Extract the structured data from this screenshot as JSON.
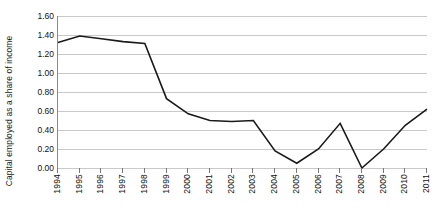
{
  "chart_data": {
    "type": "line",
    "title": "",
    "xlabel": "",
    "ylabel": "Capital employed as a share of income",
    "categories": [
      "1994",
      "1995",
      "1996",
      "1997",
      "1998",
      "1999",
      "2000",
      "2001",
      "2002",
      "2003",
      "2004",
      "2005",
      "2006",
      "2007",
      "2008",
      "2009",
      "2010",
      "2011"
    ],
    "values": [
      1.32,
      1.39,
      1.36,
      1.33,
      1.31,
      0.73,
      0.57,
      0.5,
      0.49,
      0.5,
      0.18,
      0.05,
      0.2,
      0.47,
      0.0,
      0.2,
      0.45,
      0.62
    ],
    "series": [
      {
        "name": "Capital employed as a share of income",
        "values": [
          1.32,
          1.39,
          1.36,
          1.33,
          1.31,
          0.73,
          0.57,
          0.5,
          0.49,
          0.5,
          0.18,
          0.05,
          0.2,
          0.47,
          0.0,
          0.2,
          0.45,
          0.62
        ]
      }
    ],
    "ylim": [
      0.0,
      1.6
    ],
    "ytick_labels": [
      "0.00",
      "0.20",
      "0.40",
      "0.60",
      "0.80",
      "1.00",
      "1.20",
      "1.40",
      "1.60"
    ],
    "ytick_values": [
      0.0,
      0.2,
      0.4,
      0.6,
      0.8,
      1.0,
      1.2,
      1.4,
      1.6
    ],
    "grid": true,
    "legend": "none",
    "line_color": "#1a1a1a",
    "grid_color": "#c9c9c9",
    "axis_color": "#8a8a8a",
    "background_color": "#ffffff"
  }
}
